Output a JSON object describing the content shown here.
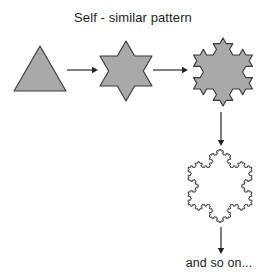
{
  "figure": {
    "title": "Self - similar pattern",
    "caption": "and so on...",
    "background_color": "#ffffff",
    "fill_color": "#a9a9a9",
    "outline_color": "#3a3a3a",
    "arrow_color": "#222222",
    "text_color": "#1d1d1d"
  },
  "shapes": [
    {
      "name": "triangle",
      "label": "equilateral triangle",
      "koch_iteration": 0,
      "filled": true,
      "center_x": 40,
      "center_y": 76,
      "radius": 30,
      "rotation_deg": -90
    },
    {
      "name": "six-point-star",
      "label": "Star of David / Koch iteration 1",
      "koch_iteration": 1,
      "filled": true,
      "center_x": 126,
      "center_y": 71,
      "radius": 30,
      "rotation_deg": -90
    },
    {
      "name": "koch-snowflake-stage-2",
      "label": "Koch snowflake iteration 2",
      "koch_iteration": 2,
      "filled": true,
      "center_x": 223,
      "center_y": 72,
      "radius": 34,
      "rotation_deg": -90
    },
    {
      "name": "koch-snowflake-stage-4",
      "label": "Koch snowflake iteration 4",
      "koch_iteration": 4,
      "filled": false,
      "center_x": 220,
      "center_y": 186,
      "radius": 37,
      "rotation_deg": -90
    }
  ],
  "arrows": [
    {
      "name": "arrow-triangle-to-star",
      "direction": "right",
      "x1": 67,
      "y1": 70,
      "x2": 98,
      "y2": 70
    },
    {
      "name": "arrow-star-to-snowflake2",
      "direction": "right",
      "x1": 153,
      "y1": 70,
      "x2": 188,
      "y2": 70
    },
    {
      "name": "arrow-snowflake2-to-snowflake4",
      "direction": "down",
      "x1": 221,
      "y1": 112,
      "x2": 221,
      "y2": 146
    },
    {
      "name": "arrow-snowflake4-to-caption",
      "direction": "down",
      "x1": 221,
      "y1": 227,
      "x2": 221,
      "y2": 254
    }
  ]
}
